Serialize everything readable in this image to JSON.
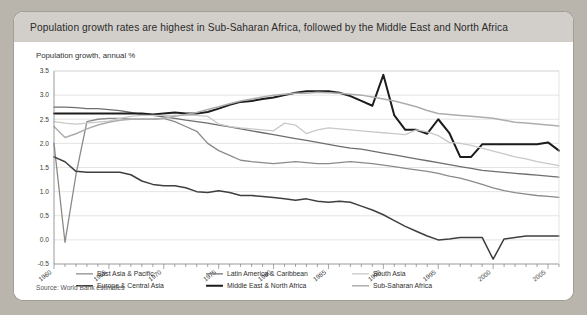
{
  "page_bleed_text": "   ",
  "card": {
    "title": "Population growth rates are highest in Sub-Saharan Africa, followed by the Middle East and North Africa",
    "axis_caption": "Population growth, annual %",
    "source": "Source: World Bank estimates"
  },
  "colors": {
    "card_background": "#ffffff",
    "header_band": "#d2cfca",
    "page_background": "#b9b5ad",
    "grid": "#d8d8d8",
    "axis": "#808080",
    "east_asia_pacific": "#8a8a8a",
    "europe_central_asia": "#3f3f3f",
    "latin_america_caribbean": "#6e6e6e",
    "middle_east_north_africa": "#1c1c1c",
    "south_asia": "#c9c9c9",
    "sub_saharan_africa": "#adadad"
  },
  "legend": {
    "entries": [
      {
        "label": "East Asia & Pacific",
        "color": "#8a8a8a",
        "width": 1.3
      },
      {
        "label": "Europe & Central Asia",
        "color": "#3f3f3f",
        "width": 1.5
      },
      {
        "label": "Latin America & Caribbean",
        "color": "#6e6e6e",
        "width": 1.3
      },
      {
        "label": "Middle East & North Africa",
        "color": "#1c1c1c",
        "width": 2.0
      },
      {
        "label": "South Asia",
        "color": "#c9c9c9",
        "width": 1.3
      },
      {
        "label": "Sub-Saharan Africa",
        "color": "#adadad",
        "width": 1.5
      }
    ]
  },
  "chart_data": {
    "type": "line",
    "title": "Population growth rates are highest in Sub-Saharan Africa, followed by the Middle East and North Africa",
    "subtitle": "Population growth, annual %",
    "xlabel": "",
    "ylabel": "Population growth, annual %",
    "xlim": [
      1960,
      2006
    ],
    "ylim": [
      -0.5,
      3.5
    ],
    "ytick_step": 0.5,
    "yticks": [
      -0.5,
      0.0,
      0.5,
      1.0,
      1.5,
      2.0,
      2.5,
      3.0,
      3.5
    ],
    "xticks_labeled": [
      1960,
      1965,
      1970,
      1975,
      1980,
      1985,
      1990,
      1995,
      2000,
      2005
    ],
    "xtick_step": 1,
    "grid": "horizontal",
    "legend_position": "bottom-inside",
    "source": "Source: World Bank estimates",
    "x": [
      1960,
      1961,
      1962,
      1963,
      1964,
      1965,
      1966,
      1967,
      1968,
      1969,
      1970,
      1971,
      1972,
      1973,
      1974,
      1975,
      1976,
      1977,
      1978,
      1979,
      1980,
      1981,
      1982,
      1983,
      1984,
      1985,
      1986,
      1987,
      1988,
      1989,
      1990,
      1991,
      1992,
      1993,
      1994,
      1995,
      1996,
      1997,
      1998,
      1999,
      2000,
      2001,
      2002,
      2003,
      2004,
      2005,
      2006
    ],
    "series": [
      {
        "name": "East Asia & Pacific",
        "color": "#8a8a8a",
        "values": [
          2.0,
          -0.05,
          1.35,
          2.45,
          2.5,
          2.52,
          2.52,
          2.5,
          2.5,
          2.5,
          2.52,
          2.45,
          2.35,
          2.25,
          2.0,
          1.85,
          1.75,
          1.65,
          1.62,
          1.6,
          1.58,
          1.6,
          1.62,
          1.6,
          1.58,
          1.58,
          1.6,
          1.62,
          1.6,
          1.58,
          1.55,
          1.52,
          1.48,
          1.45,
          1.42,
          1.38,
          1.32,
          1.28,
          1.22,
          1.15,
          1.08,
          1.02,
          0.98,
          0.95,
          0.92,
          0.9,
          0.88
        ]
      },
      {
        "name": "Europe & Central Asia",
        "color": "#3f3f3f",
        "values": [
          1.72,
          1.62,
          1.42,
          1.4,
          1.4,
          1.4,
          1.4,
          1.35,
          1.22,
          1.15,
          1.12,
          1.12,
          1.08,
          1.0,
          0.98,
          1.02,
          0.98,
          0.92,
          0.92,
          0.9,
          0.88,
          0.85,
          0.82,
          0.85,
          0.8,
          0.78,
          0.8,
          0.78,
          0.7,
          0.62,
          0.52,
          0.4,
          0.28,
          0.18,
          0.08,
          0.0,
          0.02,
          0.05,
          0.05,
          0.05,
          -0.4,
          0.02,
          0.05,
          0.08,
          0.08,
          0.08,
          0.08
        ]
      },
      {
        "name": "Latin America & Caribbean",
        "color": "#6e6e6e",
        "values": [
          2.75,
          2.75,
          2.74,
          2.72,
          2.72,
          2.7,
          2.68,
          2.64,
          2.6,
          2.58,
          2.55,
          2.52,
          2.48,
          2.45,
          2.42,
          2.38,
          2.34,
          2.3,
          2.26,
          2.22,
          2.18,
          2.14,
          2.1,
          2.06,
          2.02,
          1.98,
          1.94,
          1.9,
          1.88,
          1.84,
          1.8,
          1.76,
          1.72,
          1.68,
          1.64,
          1.6,
          1.56,
          1.52,
          1.48,
          1.44,
          1.42,
          1.4,
          1.38,
          1.36,
          1.34,
          1.32,
          1.3
        ]
      },
      {
        "name": "Middle East & North Africa",
        "color": "#1c1c1c",
        "values": [
          2.62,
          2.62,
          2.62,
          2.62,
          2.62,
          2.62,
          2.62,
          2.62,
          2.62,
          2.6,
          2.62,
          2.64,
          2.62,
          2.62,
          2.65,
          2.72,
          2.8,
          2.86,
          2.88,
          2.92,
          2.95,
          3.0,
          3.05,
          3.08,
          3.08,
          3.08,
          3.05,
          2.98,
          2.88,
          2.78,
          3.42,
          2.58,
          2.28,
          2.28,
          2.2,
          2.5,
          2.22,
          1.72,
          1.72,
          1.98,
          1.98,
          1.98,
          1.98,
          1.98,
          1.98,
          2.02,
          1.85
        ]
      },
      {
        "name": "South Asia",
        "color": "#c9c9c9",
        "values": [
          2.45,
          2.42,
          2.4,
          2.42,
          2.44,
          2.46,
          2.52,
          2.56,
          2.58,
          2.58,
          2.58,
          2.58,
          2.58,
          2.58,
          2.56,
          2.4,
          2.35,
          2.32,
          2.3,
          2.28,
          2.26,
          2.42,
          2.38,
          2.2,
          2.28,
          2.32,
          2.3,
          2.28,
          2.26,
          2.24,
          2.22,
          2.2,
          2.18,
          2.28,
          2.24,
          2.16,
          2.02,
          2.0,
          1.96,
          1.9,
          1.84,
          1.78,
          1.72,
          1.68,
          1.62,
          1.58,
          1.54
        ]
      },
      {
        "name": "Sub-Saharan Africa",
        "color": "#adadad",
        "values": [
          2.35,
          2.12,
          2.2,
          2.3,
          2.38,
          2.44,
          2.48,
          2.5,
          2.5,
          2.5,
          2.52,
          2.56,
          2.6,
          2.64,
          2.7,
          2.76,
          2.82,
          2.88,
          2.92,
          2.96,
          3.0,
          3.02,
          3.04,
          3.04,
          3.06,
          3.05,
          3.04,
          3.02,
          3.0,
          2.96,
          2.92,
          2.88,
          2.82,
          2.76,
          2.68,
          2.62,
          2.6,
          2.58,
          2.56,
          2.54,
          2.52,
          2.48,
          2.44,
          2.42,
          2.4,
          2.38,
          2.36
        ]
      }
    ]
  }
}
